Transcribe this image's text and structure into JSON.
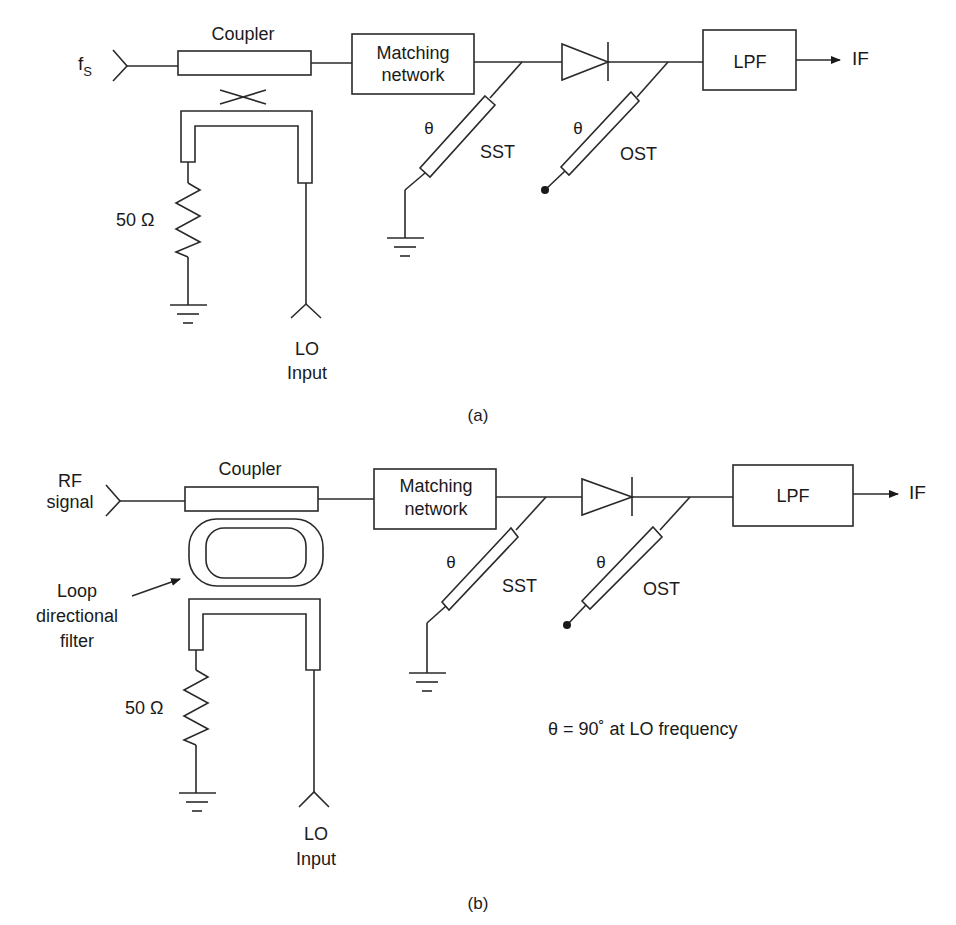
{
  "figure_a": {
    "caption": "(a)",
    "input_label_main": "f",
    "input_label_sub": "S",
    "coupler_label": "Coupler",
    "matching_network_line1": "Matching",
    "matching_network_line2": "network",
    "sst_theta": "θ",
    "sst_label": "SST",
    "ost_theta": "θ",
    "ost_label": "OST",
    "lpf_label": "LPF",
    "output_label": "IF",
    "resistor_label": "50 Ω",
    "lo_line1": "LO",
    "lo_line2": "Input"
  },
  "figure_b": {
    "caption": "(b)",
    "input_line1": "RF",
    "input_line2": "signal",
    "coupler_label": "Coupler",
    "loop_line1": "Loop",
    "loop_line2": "directional",
    "loop_line3": "filter",
    "matching_network_line1": "Matching",
    "matching_network_line2": "network",
    "sst_theta": "θ",
    "sst_label": "SST",
    "ost_theta": "θ",
    "ost_label": "OST",
    "lpf_label": "LPF",
    "output_label": "IF",
    "resistor_label": "50 Ω",
    "lo_line1": "LO",
    "lo_line2": "Input",
    "note": "θ = 90˚ at LO frequency"
  }
}
